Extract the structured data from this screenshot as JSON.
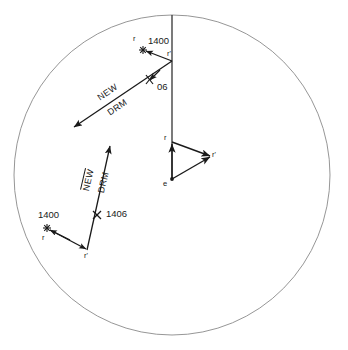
{
  "diagram": {
    "colors": {
      "circle_stroke": "#8a8a8a",
      "line_stroke": "#1a1a1a",
      "text": "#1a1a1a",
      "background": "#ffffff"
    },
    "circle": {
      "cx": 172,
      "cy": 175,
      "r": 160
    }
  },
  "labels": {
    "top_r": "r",
    "top_time_1400": "1400",
    "top_r_prime": "r'",
    "top_time_06": "06",
    "upper_vector_line1": "NEW",
    "upper_vector_line2": "DRM",
    "lower_vector_line1": "NEW",
    "lower_vector_line2": "DRM",
    "lower_time_1406": "1406",
    "lower_time_1400": "1400",
    "lower_r": "r",
    "lower_r_prime": "r'",
    "triangle_r": "r",
    "triangle_r_prime": "r'",
    "triangle_e": "e"
  },
  "geometry": {
    "vertical_line": {
      "x": 172,
      "y_top": 15,
      "y_bottom": 178
    },
    "upper_plot": {
      "star_point": [
        143,
        50
      ],
      "vertex_point": [
        172,
        61
      ],
      "tick_06": [
        150,
        80
      ],
      "arrow_tip": [
        74,
        127
      ]
    },
    "lower_plot": {
      "star_point": [
        47,
        228
      ],
      "vertex_point": [
        87,
        250
      ],
      "tick_1406": [
        98,
        215
      ],
      "arrow_tip": [
        110,
        146
      ]
    },
    "triangle": {
      "r": [
        172,
        142
      ],
      "r_prime": [
        212,
        156
      ],
      "e": [
        172,
        180
      ]
    }
  }
}
